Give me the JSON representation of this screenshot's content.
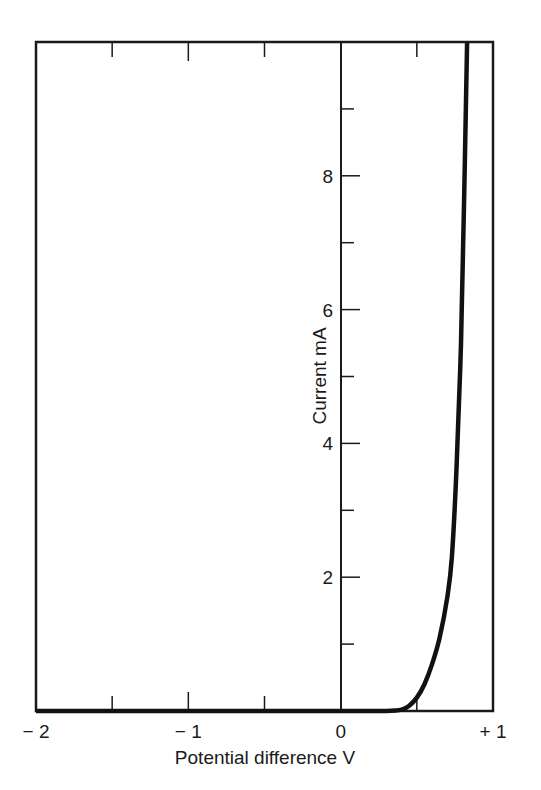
{
  "chart_data": {
    "type": "line",
    "title": "",
    "xlabel": "Potential difference V",
    "ylabel": "Current mA",
    "xlim": [
      -2,
      1
    ],
    "ylim": [
      0,
      10
    ],
    "grid": false,
    "legend": null,
    "x_ticks": [
      -2,
      -1.5,
      -1,
      -0.5,
      0,
      0.5,
      1
    ],
    "x_tick_labels": [
      {
        "value": -2,
        "label": "− 2"
      },
      {
        "value": -1,
        "label": "− 1"
      },
      {
        "value": 0,
        "label": "0"
      },
      {
        "value": 1,
        "label": "+ 1"
      }
    ],
    "y_ticks": [
      1,
      2,
      3,
      4,
      5,
      6,
      7,
      8,
      9
    ],
    "y_tick_labels": [
      {
        "value": 2,
        "label": "2"
      },
      {
        "value": 4,
        "label": "4"
      },
      {
        "value": 6,
        "label": "6"
      },
      {
        "value": 8,
        "label": "8"
      }
    ],
    "series": [
      {
        "name": "Diode I-V characteristic",
        "x": [
          -2.0,
          -1.0,
          0.0,
          0.3,
          0.4,
          0.45,
          0.5,
          0.55,
          0.6,
          0.65,
          0.7,
          0.73,
          0.76,
          0.79,
          0.81,
          0.83
        ],
        "y": [
          0.0,
          0.0,
          0.0,
          0.0,
          0.02,
          0.08,
          0.2,
          0.4,
          0.7,
          1.1,
          1.7,
          2.3,
          3.6,
          5.5,
          7.6,
          10.0
        ]
      }
    ]
  }
}
